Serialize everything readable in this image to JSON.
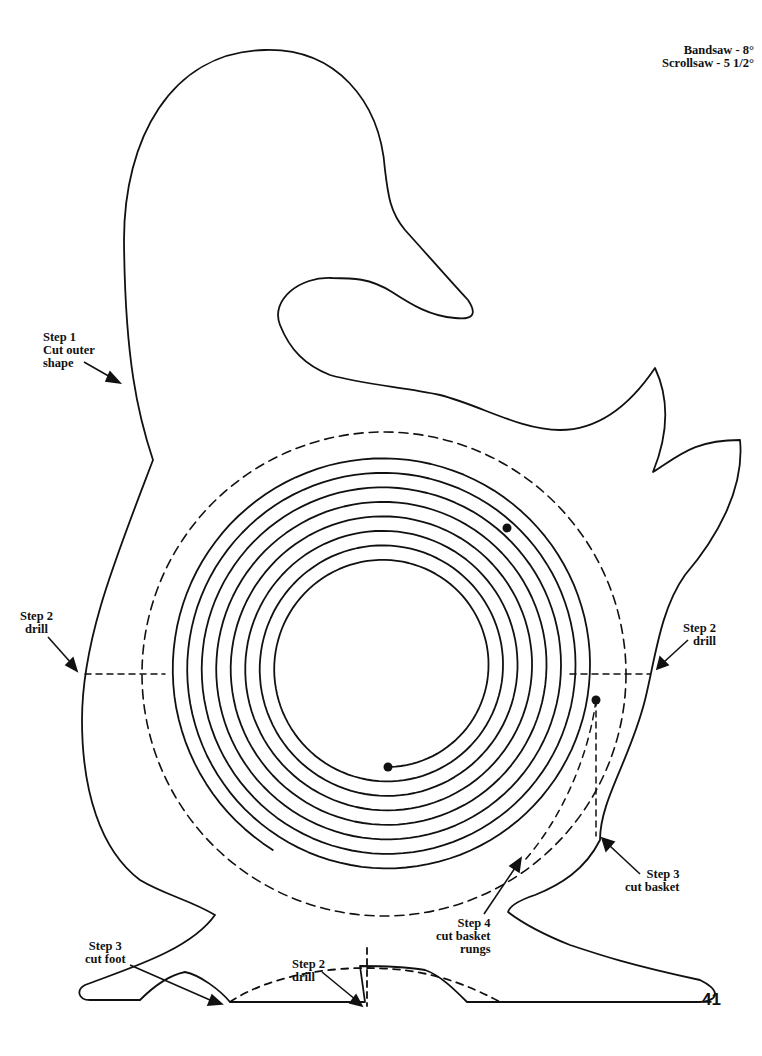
{
  "header": {
    "saw_angles": [
      {
        "text": "Bandsaw - 8°"
      },
      {
        "text": "Scrollsaw - 5 1/2°"
      }
    ]
  },
  "labels": {
    "step1_outer": {
      "lines": [
        "Step 1",
        "Cut outer",
        "shape"
      ]
    },
    "step2_left_drill": {
      "lines": [
        "Step 2",
        "drill"
      ]
    },
    "step2_right_drill": {
      "lines": [
        "Step 2",
        "drill"
      ]
    },
    "step3_cut_basket": {
      "lines": [
        "Step 3",
        "cut basket"
      ]
    },
    "step4_rungs": {
      "lines": [
        "Step 4",
        "cut basket",
        "rungs"
      ]
    },
    "step3_cut_foot": {
      "lines": [
        "Step 3",
        "cut foot"
      ]
    },
    "step2_bottom_drill": {
      "lines": [
        "Step 2",
        "drill"
      ]
    }
  },
  "page_number": "41",
  "colors": {
    "ink": "#111111",
    "paper": "#ffffff"
  },
  "pattern": {
    "spiral": {
      "center_x": 385,
      "center_y": 667,
      "inner_radius": 100,
      "turns": 8,
      "pitch": 14.5,
      "start_dot": {
        "x": 388,
        "y": 767
      },
      "end_dot": {
        "x": 507,
        "y": 528
      },
      "drill_dot": {
        "x": 596,
        "y": 700
      }
    },
    "basket_dashed_circle": {
      "cx": 384,
      "cy": 674,
      "r": 242
    }
  }
}
